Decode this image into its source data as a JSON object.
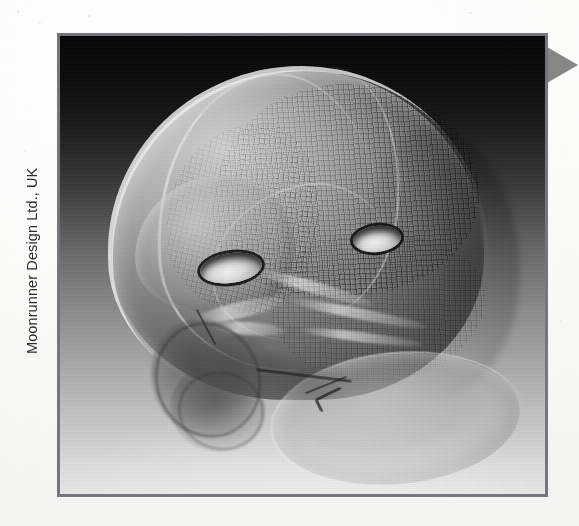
{
  "page": {
    "background_color": "#fdfdfd",
    "paper_tint": "#f4f4f3"
  },
  "photo_credit": {
    "text": "Moonrunner Design Ltd., UK",
    "orientation": "rotated-90-ccw",
    "color": "#2b2b2b"
  },
  "edge_marker": {
    "shape": "right-pointing-triangle",
    "color": "#7d7d7d",
    "label": ""
  },
  "figure": {
    "frame_color": "#73767b",
    "frame_width_px": 3,
    "caption": "",
    "render": {
      "subject": "infant skull volumetric ct rendering",
      "style": "grayscale volume render with wireframe mesh overlay",
      "background_gradient_top": "#050505",
      "background_gradient_bottom": "#e8e8e8",
      "features": [
        "cranial dome with quadrilateral mesh texture",
        "coronal suture line",
        "sagittal suture line",
        "temporal suture line",
        "frontal burr hole",
        "parietal burr hole",
        "dark basal orbital cluster",
        "mandible and neck ellipse",
        "occipital shading"
      ],
      "burr_holes": [
        {
          "name": "frontal-burr-hole",
          "rim_color": "#0a0a0a",
          "interior_color": "#f2f2f2"
        },
        {
          "name": "parietal-burr-hole",
          "rim_color": "#0a0a0a",
          "interior_color": "#f2f2f2"
        }
      ]
    }
  }
}
